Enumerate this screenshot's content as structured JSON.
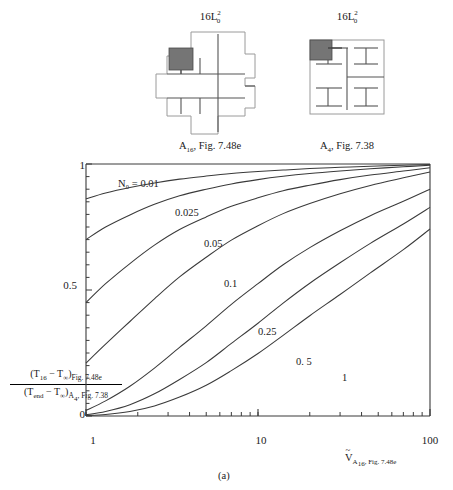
{
  "figure": {
    "panel_caption": "(a)"
  },
  "schematics": [
    {
      "name": "a16-fig-7-48e",
      "title_prefix": "16L",
      "title_sup": "2",
      "title_sub": "0",
      "caption_prefix": "A",
      "caption_sub": "16",
      "caption_suffix": ", Fig. 7.48e"
    },
    {
      "name": "a4-fig-7-38",
      "title_prefix": "16L",
      "title_sup": "2",
      "title_sub": "0",
      "caption_prefix": "A",
      "caption_sub": "4",
      "caption_suffix": ", Fig. 7.38"
    }
  ],
  "axis": {
    "y_ticks": [
      "1",
      "0.5",
      "0"
    ],
    "x_ticks": [
      "1",
      "10",
      "100"
    ],
    "ylabel": {
      "num_a": "(T",
      "num_sub1": "16",
      "num_b": " − T",
      "num_sub2": "∞",
      "num_c": ")",
      "num_tag": "Fig. 7.48e",
      "den_a": "(T",
      "den_sub1": "end",
      "den_b": " − T",
      "den_sub2": "∞",
      "den_c": ")",
      "den_tag_a": "A",
      "den_tag_sub": "4",
      "den_tag_b": ", Fig. 7.38"
    },
    "xlabel": {
      "symbol": "V",
      "sub_a": "A",
      "sub_sub": "16",
      "sub_b": ", Fig. 7.48e"
    }
  },
  "curve_labels": [
    "N₀ = 0.01",
    "0.025",
    "0.05",
    "0.1",
    "0.25",
    "0. 5",
    "1"
  ],
  "chart_data": {
    "type": "line",
    "title": "",
    "xlabel": "V~_{A16, Fig. 7.48e}",
    "ylabel": "(T16 - Tinf)|Fig.7.48e / (Tend - Tinf)_{A4, Fig.7.38}",
    "xscale": "log",
    "xlim": [
      1,
      100
    ],
    "ylim": [
      0,
      1
    ],
    "grid": false,
    "legend": "inline-curve-labels",
    "x": [
      1,
      1.3,
      1.8,
      2.5,
      3.5,
      5,
      7,
      10,
      14,
      20,
      30,
      45,
      70,
      100
    ],
    "series": [
      {
        "name": "N0 = 0.01",
        "values": [
          0.862,
          0.885,
          0.907,
          0.925,
          0.94,
          0.952,
          0.962,
          0.97,
          0.976,
          0.982,
          0.987,
          0.991,
          0.995,
          0.998
        ]
      },
      {
        "name": "0.025",
        "values": [
          0.7,
          0.75,
          0.798,
          0.84,
          0.874,
          0.9,
          0.921,
          0.938,
          0.951,
          0.962,
          0.972,
          0.981,
          0.989,
          0.995
        ]
      },
      {
        "name": "0.05",
        "values": [
          0.45,
          0.525,
          0.605,
          0.678,
          0.74,
          0.79,
          0.832,
          0.866,
          0.894,
          0.916,
          0.938,
          0.956,
          0.972,
          0.985
        ]
      },
      {
        "name": "0.1",
        "values": [
          0.21,
          0.285,
          0.375,
          0.465,
          0.552,
          0.63,
          0.698,
          0.755,
          0.803,
          0.843,
          0.882,
          0.915,
          0.945,
          0.968
        ]
      },
      {
        "name": "0.25",
        "values": [
          0.022,
          0.06,
          0.118,
          0.19,
          0.272,
          0.358,
          0.443,
          0.525,
          0.6,
          0.668,
          0.735,
          0.795,
          0.852,
          0.9
        ]
      },
      {
        "name": "0. 5",
        "values": [
          0.005,
          0.018,
          0.045,
          0.088,
          0.145,
          0.212,
          0.288,
          0.368,
          0.448,
          0.527,
          0.608,
          0.685,
          0.762,
          0.828
        ]
      },
      {
        "name": "1",
        "values": [
          0.002,
          0.006,
          0.018,
          0.04,
          0.075,
          0.122,
          0.18,
          0.248,
          0.32,
          0.398,
          0.482,
          0.568,
          0.66,
          0.742
        ]
      }
    ]
  }
}
